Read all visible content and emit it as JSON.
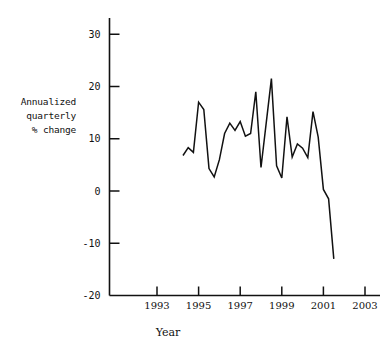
{
  "chart_data": {
    "type": "line",
    "title": "",
    "xlabel": "Year",
    "ylabel": "Annualized quarterly % change",
    "ylabel_lines": [
      "Annualized",
      "quarterly",
      "% change"
    ],
    "xlim": [
      1992.3,
      2003.7
    ],
    "ylim": [
      -20,
      33
    ],
    "grid": false,
    "legend": false,
    "line_color": "#111111",
    "xticks": [
      1993,
      1995,
      1997,
      1999,
      2001,
      2003
    ],
    "xtick_labels": [
      "1993",
      "1995",
      "1997",
      "1999",
      "2001",
      "2003"
    ],
    "yticks": [
      30,
      20,
      10,
      0,
      -10,
      -20
    ],
    "ytick_labels": [
      "30",
      "20",
      "10",
      "0",
      "-10",
      "-20"
    ],
    "series": [
      {
        "name": "Annualized quarterly % change",
        "x": [
          1994.25,
          1994.5,
          1994.75,
          1995.0,
          1995.25,
          1995.5,
          1995.75,
          1996.0,
          1996.25,
          1996.5,
          1996.75,
          1997.0,
          1997.25,
          1997.5,
          1997.75,
          1998.0,
          1998.25,
          1998.5,
          1998.75,
          1999.0,
          1999.25,
          1999.5,
          1999.75,
          2000.0,
          2000.25,
          2000.5,
          2000.75,
          2001.0,
          2001.25,
          2001.5
        ],
        "values": [
          6.8,
          8.3,
          7.4,
          17.0,
          15.6,
          4.3,
          2.7,
          6.0,
          11.0,
          13.0,
          11.6,
          13.3,
          10.5,
          11.0,
          19.0,
          4.5,
          13.0,
          21.5,
          4.8,
          2.5,
          14.2,
          6.5,
          9.0,
          8.2,
          6.4,
          15.2,
          10.3,
          0.3,
          -1.5,
          -13.0
        ]
      }
    ]
  }
}
